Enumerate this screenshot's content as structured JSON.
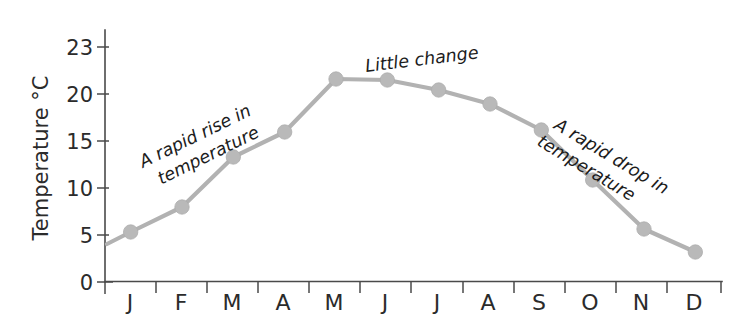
{
  "chart_data": {
    "type": "line",
    "title": "",
    "xlabel": "",
    "ylabel": "Temperature °C",
    "categories": [
      "J",
      "F",
      "M",
      "A",
      "M",
      "J",
      "J",
      "A",
      "S",
      "O",
      "N",
      "D"
    ],
    "values": [
      5.0,
      7.5,
      12.5,
      15.0,
      20.3,
      20.2,
      19.2,
      17.8,
      15.2,
      10.2,
      5.3,
      3.0
    ],
    "series": [
      {
        "name": "Temperature",
        "values": [
          5.0,
          7.5,
          12.5,
          15.0,
          20.3,
          20.2,
          19.2,
          17.8,
          15.2,
          10.2,
          5.3,
          3.0
        ]
      }
    ],
    "ylim": [
      0,
      25
    ],
    "xlim": [
      0,
      12
    ],
    "y_tick_labels": [
      "0",
      "5",
      "10",
      "15",
      "20",
      "23"
    ],
    "y_tick_values": [
      0,
      5,
      10,
      15,
      20,
      25
    ],
    "x_tick_labels": [
      "J",
      "F",
      "M",
      "A",
      "M",
      "J",
      "J",
      "A",
      "S",
      "O",
      "N",
      "D"
    ],
    "grid": false,
    "legend": "none",
    "marker": "circle",
    "line_color": "#b2b2b2",
    "marker_color": "#b9b9b9",
    "axis_color": "#4a4a4a",
    "text_color": "#1c1c1c",
    "annotations": [
      {
        "id": "rise",
        "text_line_1": "A rapid rise in",
        "text_line_2": "temperature",
        "rotation": -26
      },
      {
        "id": "little-change",
        "text_line_1": "Little change",
        "text_line_2": "",
        "rotation": -7
      },
      {
        "id": "drop",
        "text_line_1": "A rapid drop in",
        "text_line_2": "temperature",
        "rotation": 31
      }
    ]
  },
  "axis": {
    "y_title": "Temperature °C"
  }
}
